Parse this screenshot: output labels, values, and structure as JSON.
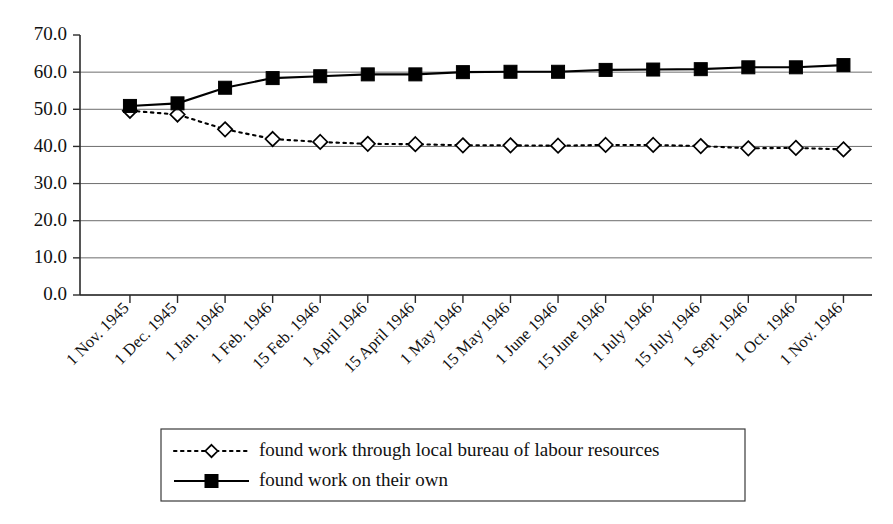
{
  "chart_data": {
    "type": "line",
    "title": "",
    "subtitle": "",
    "xlabel": "",
    "ylabel": "",
    "ylim": [
      0.0,
      70.0
    ],
    "ytick_step": 10.0,
    "grid": true,
    "legend_position": "bottom",
    "ytick_labels": [
      "70.0",
      "60.0",
      "50.0",
      "40.0",
      "30.0",
      "20.0",
      "10.0",
      "0.0"
    ],
    "ytick_values": [
      70.0,
      60.0,
      50.0,
      40.0,
      30.0,
      20.0,
      10.0,
      0.0
    ],
    "categories": [
      "1 Nov. 1945",
      "1 Dec. 1945",
      "1 Jan. 1946",
      "1 Feb. 1946",
      "15 Feb. 1946",
      "1 April 1946",
      "15 April 1946",
      "1 May 1946",
      "15 May 1946",
      "1 June 1946",
      "15 June 1946",
      "1 July 1946",
      "15 July 1946",
      "1 Sept. 1946",
      "1 Oct. 1946",
      "1 Nov. 1946"
    ],
    "series": [
      {
        "name": "found work through local bureau of labour resources",
        "marker": "diamond",
        "line_style": "dotted",
        "values": [
          49.6,
          48.6,
          44.6,
          42.0,
          41.2,
          40.7,
          40.6,
          40.3,
          40.3,
          40.2,
          40.4,
          40.4,
          40.1,
          39.5,
          39.6,
          39.2
        ]
      },
      {
        "name": "found work on their own",
        "marker": "square",
        "line_style": "solid",
        "values": [
          50.9,
          51.6,
          55.8,
          58.4,
          58.9,
          59.4,
          59.4,
          60.0,
          60.1,
          60.1,
          60.6,
          60.7,
          60.8,
          61.3,
          61.3,
          61.9
        ]
      }
    ]
  },
  "legend": {
    "entries": [
      {
        "label": "found work through local bureau of labour resources",
        "marker": "diamond",
        "line_style": "dotted"
      },
      {
        "label": "found work on their own",
        "marker": "square",
        "line_style": "solid"
      }
    ]
  }
}
